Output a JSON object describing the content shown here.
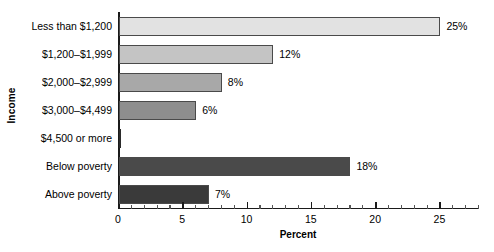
{
  "chart_data": {
    "type": "bar",
    "orientation": "horizontal",
    "title": "",
    "xlabel": "Percent",
    "ylabel": "Income",
    "categories": [
      "Less than $1,200",
      "$1,200–$1,999",
      "$2,000–$2,999",
      "$3,000–$4,499",
      "$4,500 or more",
      "Below poverty",
      "Above poverty"
    ],
    "values": [
      25,
      12,
      8,
      6,
      0,
      18,
      7
    ],
    "data_labels": [
      "25%",
      "12%",
      "8%",
      "6%",
      "",
      "18%",
      "7%"
    ],
    "bar_colors": [
      "#e2e2e2",
      "#c4c4c4",
      "#a8a8a8",
      "#8e8e8e",
      "#7a7a7a",
      "#4a4a4a",
      "#3a3a3a"
    ],
    "xlim": [
      0,
      28
    ],
    "xticks": [
      0,
      5,
      10,
      15,
      20,
      25
    ],
    "xtick_labels": [
      "0",
      "5",
      "10",
      "15",
      "20",
      "25"
    ],
    "minor_tick_step": 1,
    "grid": false,
    "legend": "none",
    "axis_color": "#1a1a1a",
    "bar_edge_color": "#4a4a4a"
  }
}
